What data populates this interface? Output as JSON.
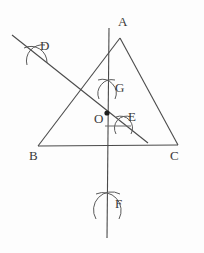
{
  "figure": {
    "kind": "geometry-construction-diagram",
    "width": 204,
    "height": 253,
    "background_color": "#fdfdfd",
    "stroke_color": "#4a4a4a",
    "label_color": "#3a3a3a"
  },
  "labels": {
    "A": "A",
    "B": "B",
    "C": "C",
    "D": "D",
    "E": "E",
    "F": "F",
    "G": "G",
    "O": "O"
  },
  "label_positions": {
    "A": {
      "x": 118,
      "y": 15
    },
    "B": {
      "x": 29,
      "y": 149
    },
    "C": {
      "x": 170,
      "y": 149
    },
    "D": {
      "x": 40,
      "y": 39
    },
    "E": {
      "x": 128,
      "y": 110
    },
    "F": {
      "x": 115,
      "y": 197
    },
    "G": {
      "x": 115,
      "y": 81
    },
    "O": {
      "x": 94,
      "y": 112
    }
  },
  "points": {
    "A": {
      "x": 120,
      "y": 38
    },
    "B": {
      "x": 38,
      "y": 146
    },
    "C": {
      "x": 178,
      "y": 145
    },
    "D": {
      "x": 36,
      "y": 55
    },
    "E": {
      "x": 124,
      "y": 125
    },
    "F": {
      "x": 108,
      "y": 207
    },
    "G": {
      "x": 107,
      "y": 89
    },
    "O": {
      "x": 107,
      "y": 113
    }
  },
  "segments": {
    "side_AB": {
      "x1": 120,
      "y1": 38,
      "x2": 38,
      "y2": 146
    },
    "side_AC": {
      "x1": 120,
      "y1": 38,
      "x2": 178,
      "y2": 145
    },
    "side_BC": {
      "x1": 38,
      "y1": 146,
      "x2": 178,
      "y2": 145
    },
    "vertical_line": {
      "x1": 109,
      "y1": 28,
      "x2": 107,
      "y2": 238
    },
    "diagonal_line": {
      "x1": 12,
      "y1": 35,
      "x2": 148,
      "y2": 143
    },
    "tick_near_E": {
      "x1": 105,
      "y1": 126,
      "x2": 131,
      "y2": 126
    }
  },
  "arc_marks": {
    "D": {
      "x": 36,
      "y": 55,
      "r": 13,
      "label": "arc-cross-D"
    },
    "G": {
      "x": 107,
      "y": 89,
      "r": 11,
      "label": "arc-cross-G"
    },
    "E": {
      "x": 124,
      "y": 125,
      "r": 10,
      "label": "arc-cross-E"
    },
    "F": {
      "x": 108,
      "y": 207,
      "r": 14,
      "label": "arc-cross-F"
    }
  }
}
